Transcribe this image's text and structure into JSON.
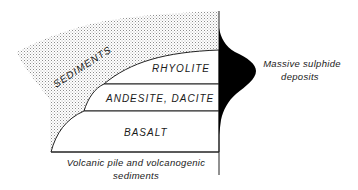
{
  "diagram": {
    "layers": [
      {
        "id": "sediments",
        "label": "SEDIMENTS"
      },
      {
        "id": "rhyolite",
        "label": "RHYOLITE"
      },
      {
        "id": "andesite",
        "label": "ANDESITE, DACITE"
      },
      {
        "id": "basalt",
        "label": "BASALT"
      }
    ],
    "base_label": {
      "line1": "Volcanic pile and volcanogenic",
      "line2": "sediments"
    },
    "deposit_label": {
      "line1": "Massive sulphide",
      "line2": "deposits"
    },
    "colors": {
      "line": "#222222",
      "deposit": "#000000",
      "sediment_dots": "#9a9a9a"
    }
  }
}
